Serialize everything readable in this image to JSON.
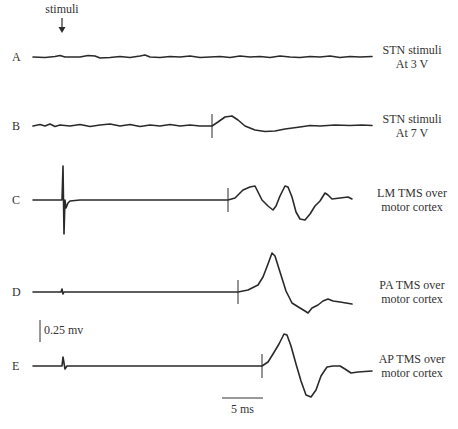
{
  "chart_data": {
    "type": "line",
    "title": "",
    "annotation": {
      "text": "stimuli",
      "arrow": "down",
      "x": 62,
      "y_text": 13,
      "arrow_top": 18,
      "arrow_bottom": 33
    },
    "scale_bars": {
      "voltage": {
        "label": "0.25 mv",
        "value": 0.25,
        "unit": "mv",
        "x": 40,
        "y1": 320,
        "y2": 342
      },
      "time": {
        "label": "5 ms",
        "value": 5,
        "unit": "ms",
        "x1": 222,
        "x2": 263,
        "y": 398
      }
    },
    "series": [
      {
        "name": "A",
        "label_lines": [
          "STN stimuli",
          "At 3 V"
        ],
        "baseline_y": 57,
        "x_start": 33,
        "x_end": 372,
        "stim_x": null,
        "points": [
          [
            33,
            57
          ],
          [
            45,
            57.5
          ],
          [
            55,
            56.5
          ],
          [
            60,
            55.5
          ],
          [
            65,
            57
          ],
          [
            80,
            57
          ],
          [
            88,
            55.5
          ],
          [
            95,
            56
          ],
          [
            100,
            58
          ],
          [
            110,
            57.5
          ],
          [
            120,
            56.5
          ],
          [
            130,
            57.5
          ],
          [
            140,
            56
          ],
          [
            145,
            55
          ],
          [
            150,
            57
          ],
          [
            160,
            57.5
          ],
          [
            170,
            56.5
          ],
          [
            180,
            57
          ],
          [
            190,
            56
          ],
          [
            200,
            57.5
          ],
          [
            210,
            57
          ],
          [
            220,
            56.5
          ],
          [
            230,
            57.5
          ],
          [
            240,
            56
          ],
          [
            250,
            57
          ],
          [
            260,
            56.5
          ],
          [
            270,
            57.5
          ],
          [
            280,
            56
          ],
          [
            290,
            57
          ],
          [
            300,
            57.5
          ],
          [
            310,
            56.5
          ],
          [
            320,
            57
          ],
          [
            330,
            56
          ],
          [
            340,
            57.5
          ],
          [
            350,
            56.5
          ],
          [
            360,
            57
          ],
          [
            372,
            56.5
          ]
        ]
      },
      {
        "name": "B",
        "label_lines": [
          "STN stimuli",
          "At 7 V"
        ],
        "baseline_y": 126,
        "x_start": 33,
        "x_end": 372,
        "stim_x": 212,
        "points": [
          [
            33,
            126
          ],
          [
            40,
            124.5
          ],
          [
            45,
            126
          ],
          [
            50,
            124
          ],
          [
            55,
            126.5
          ],
          [
            60,
            125
          ],
          [
            70,
            126
          ],
          [
            80,
            124.5
          ],
          [
            90,
            126.5
          ],
          [
            100,
            125
          ],
          [
            110,
            124
          ],
          [
            120,
            126
          ],
          [
            130,
            124.5
          ],
          [
            140,
            126.5
          ],
          [
            150,
            125
          ],
          [
            160,
            126
          ],
          [
            170,
            124.5
          ],
          [
            180,
            126
          ],
          [
            190,
            125
          ],
          [
            200,
            126
          ],
          [
            212,
            126
          ],
          [
            218,
            122
          ],
          [
            225,
            117
          ],
          [
            232,
            116
          ],
          [
            238,
            120
          ],
          [
            245,
            126
          ],
          [
            255,
            130
          ],
          [
            265,
            131.5
          ],
          [
            275,
            131
          ],
          [
            285,
            129
          ],
          [
            300,
            127
          ],
          [
            310,
            125.5
          ],
          [
            320,
            126
          ],
          [
            335,
            125
          ],
          [
            350,
            125.5
          ],
          [
            362,
            125
          ],
          [
            372,
            125.5
          ]
        ]
      },
      {
        "name": "C",
        "label_lines": [
          "LM TMS over",
          "motor cortex"
        ],
        "baseline_y": 200,
        "x_start": 33,
        "x_end": 372,
        "stim_x": 228,
        "points": [
          [
            33,
            200
          ],
          [
            62,
            200
          ],
          [
            63,
            166
          ],
          [
            64,
            234
          ],
          [
            65,
            200
          ],
          [
            66,
            208
          ],
          [
            68,
            203
          ],
          [
            70,
            201
          ],
          [
            80,
            200
          ],
          [
            228,
            200
          ],
          [
            235,
            198
          ],
          [
            243,
            190
          ],
          [
            250,
            187
          ],
          [
            255,
            186
          ],
          [
            258,
            192
          ],
          [
            262,
            200
          ],
          [
            268,
            206
          ],
          [
            273,
            210
          ],
          [
            276,
            206
          ],
          [
            280,
            196
          ],
          [
            285,
            186
          ],
          [
            288,
            187
          ],
          [
            292,
            197
          ],
          [
            296,
            212
          ],
          [
            300,
            219
          ],
          [
            305,
            220
          ],
          [
            310,
            214
          ],
          [
            315,
            206
          ],
          [
            320,
            201
          ],
          [
            325,
            193
          ],
          [
            328,
            195
          ],
          [
            332,
            199
          ],
          [
            340,
            198
          ],
          [
            348,
            197
          ],
          [
            352,
            199
          ]
        ]
      },
      {
        "name": "D",
        "label_lines": [
          "PA TMS over",
          "motor cortex"
        ],
        "baseline_y": 292,
        "x_start": 33,
        "x_end": 372,
        "stim_x": 238,
        "points": [
          [
            33,
            292
          ],
          [
            61,
            292
          ],
          [
            62,
            289
          ],
          [
            63,
            294
          ],
          [
            64,
            292
          ],
          [
            238,
            292
          ],
          [
            248,
            290
          ],
          [
            258,
            285
          ],
          [
            263,
            277
          ],
          [
            268,
            264
          ],
          [
            272,
            253
          ],
          [
            275,
            256
          ],
          [
            280,
            272
          ],
          [
            286,
            291
          ],
          [
            292,
            303
          ],
          [
            300,
            308
          ],
          [
            305,
            311
          ],
          [
            308,
            313
          ],
          [
            312,
            308
          ],
          [
            318,
            305
          ],
          [
            323,
            301
          ],
          [
            328,
            299
          ],
          [
            333,
            301
          ],
          [
            340,
            302
          ],
          [
            346,
            303
          ],
          [
            352,
            304
          ]
        ]
      },
      {
        "name": "E",
        "label_lines": [
          "AP TMS over",
          "motor cortex"
        ],
        "baseline_y": 366,
        "x_start": 33,
        "x_end": 372,
        "stim_x": 262,
        "points": [
          [
            33,
            366
          ],
          [
            62,
            366
          ],
          [
            63,
            357
          ],
          [
            65,
            369
          ],
          [
            67,
            366
          ],
          [
            262,
            366
          ],
          [
            268,
            362
          ],
          [
            273,
            354
          ],
          [
            279,
            344
          ],
          [
            284,
            334
          ],
          [
            287,
            335
          ],
          [
            291,
            346
          ],
          [
            296,
            364
          ],
          [
            301,
            381
          ],
          [
            306,
            395
          ],
          [
            311,
            397
          ],
          [
            316,
            390
          ],
          [
            321,
            376
          ],
          [
            327,
            367
          ],
          [
            333,
            366
          ],
          [
            340,
            366
          ],
          [
            345,
            369
          ],
          [
            351,
            373
          ],
          [
            358,
            372
          ],
          [
            372,
            371
          ]
        ]
      }
    ],
    "xlabel": "",
    "ylabel": "",
    "grid": false,
    "legend": "none"
  }
}
